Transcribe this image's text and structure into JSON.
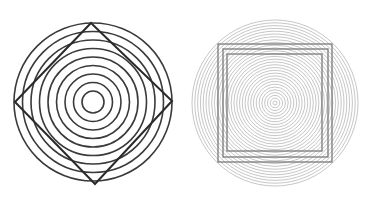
{
  "figures": [
    {
      "name": "circles-with-diamond",
      "circle_count": 9,
      "circle_color": "#3a3a3a",
      "shape": "diamond",
      "shape_count": 1,
      "shape_color": "#2a2a2a"
    },
    {
      "name": "circles-with-nested-squares",
      "circle_count": 30,
      "circle_color": "#b8b8b8",
      "shape": "square",
      "shape_count": 3,
      "shape_color": "#7a7a7a"
    }
  ]
}
